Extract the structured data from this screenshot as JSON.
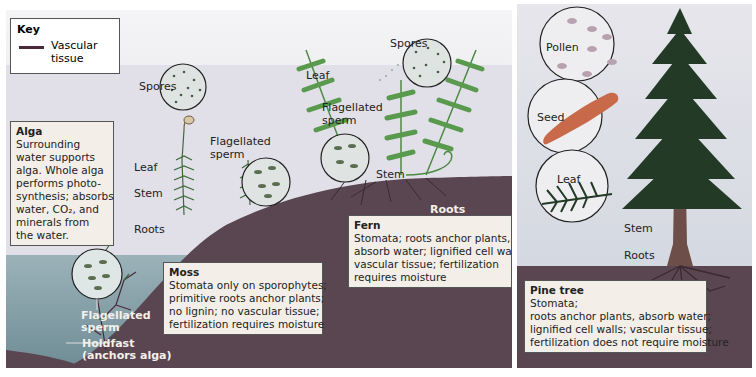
{
  "key": {
    "title": "Key",
    "items": [
      {
        "symbol": "vascular-tissue-line",
        "label_line1": "Vascular",
        "label_line2": "tissue",
        "color": "#4a2a3a"
      }
    ]
  },
  "colors": {
    "sky": "#e6e4ea",
    "water": "#8aa3ac",
    "ground": "#5a4650",
    "plant_green": "#3e6b3a",
    "fern_green": "#4f8a45",
    "pine_dark": "#223a26",
    "label_box": "#f3efe8",
    "seed": "#c86a4a",
    "pollen": "#b8a2b0"
  },
  "alga": {
    "box": {
      "title": "Alga",
      "lines": [
        "Surrounding",
        "water supports",
        "alga. Whole alga",
        "performs photo-",
        "synthesis; absorbs",
        "water,  CO₂, and",
        "minerals from",
        "the water."
      ]
    },
    "labels": {
      "flagellated_1": "Flagellated",
      "flagellated_2": "sperm",
      "holdfast_1": "Holdfast",
      "holdfast_2": "(anchors alga)"
    }
  },
  "moss": {
    "labels": {
      "spores": "Spores",
      "leaf": "Leaf",
      "stem": "Stem",
      "roots": "Roots",
      "flagellated_1": "Flagellated",
      "flagellated_2": "sperm"
    },
    "box": {
      "title": "Moss",
      "lines": [
        "Stomata only on sporophytes;",
        "primitive roots anchor plants;",
        "no lignin;  no vascular tissue;",
        "fertilization requires moisture"
      ]
    }
  },
  "fern": {
    "labels": {
      "spores": "Spores",
      "leaf": "Leaf",
      "flagellated_1": "Flagellated",
      "flagellated_2": "sperm",
      "stem": "Stem",
      "roots": "Roots"
    },
    "box": {
      "title": "Fern",
      "lines": [
        "Stomata;  roots anchor plants,",
        "absorb water;  lignified cell walls;",
        "vascular tissue;  fertilization",
        "requires moisture"
      ]
    }
  },
  "pine": {
    "labels": {
      "pollen": "Pollen",
      "seed": "Seed",
      "leaf": "Leaf",
      "stem": "Stem",
      "roots": "Roots"
    },
    "box": {
      "title": "Pine tree",
      "lines": [
        "Stomata;",
        "roots anchor plants, absorb water;",
        "lignified cell walls;  vascular tissue;",
        "fertilization does not require moisture"
      ]
    }
  }
}
